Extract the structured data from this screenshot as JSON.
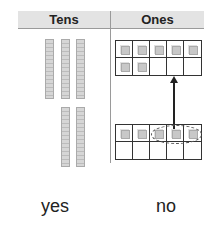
{
  "headers": {
    "tens": "Tens",
    "ones": "Ones"
  },
  "tens_rods": {
    "top_group": 3,
    "bottom_group": 2
  },
  "ones_frames": {
    "top": {
      "filled": 7,
      "cells": 10
    },
    "bottom": {
      "filled": 5,
      "cells": 10,
      "circled": [
        3,
        4,
        5
      ]
    }
  },
  "answers": {
    "yes": "yes",
    "no": "no"
  }
}
